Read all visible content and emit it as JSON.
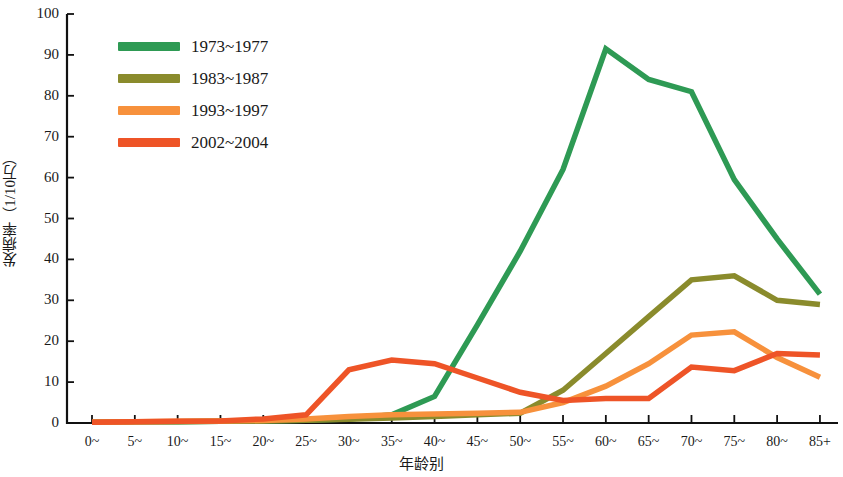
{
  "chart_data": {
    "type": "line",
    "title": "",
    "xlabel": "年龄别",
    "ylabel": "发病率（1/10万）",
    "ylim": [
      0,
      100
    ],
    "ytick_labels": [
      "100",
      "90",
      "80",
      "70",
      "60",
      "50",
      "40",
      "30",
      "20",
      "10",
      "0"
    ],
    "yticks": [
      100,
      90,
      80,
      70,
      60,
      50,
      40,
      30,
      20,
      10,
      0
    ],
    "grid": false,
    "legend_position": "top-left",
    "categories": [
      "0~",
      "5~",
      "10~",
      "15~",
      "20~",
      "25~",
      "30~",
      "35~",
      "40~",
      "45~",
      "50~",
      "55~",
      "60~",
      "65~",
      "70~",
      "75~",
      "80~",
      "85+"
    ],
    "series": [
      {
        "name": "1973~1977",
        "color": "#2E9A54",
        "values": [
          0.2,
          0.3,
          0.3,
          0.4,
          0.5,
          0.7,
          1.0,
          2.0,
          6.5,
          24.0,
          42.0,
          62.0,
          91.5,
          84.0,
          81.0,
          59.5,
          45.0,
          31.5
        ]
      },
      {
        "name": "1983~1987",
        "color": "#8A8B2C",
        "values": [
          0.2,
          0.3,
          0.3,
          0.4,
          0.5,
          0.7,
          0.9,
          1.2,
          1.6,
          2.0,
          2.4,
          8.0,
          17.0,
          26.0,
          35.0,
          36.0,
          30.0,
          29.0
        ]
      },
      {
        "name": "1993~1997",
        "color": "#F7913C",
        "values": [
          0.2,
          0.3,
          0.4,
          0.5,
          0.6,
          1.0,
          1.6,
          2.0,
          2.2,
          2.4,
          2.6,
          5.0,
          9.0,
          14.5,
          21.5,
          22.3,
          16.0,
          11.2
        ]
      },
      {
        "name": "2002~2004",
        "color": "#EE5427",
        "values": [
          0.2,
          0.3,
          0.4,
          0.5,
          1.0,
          2.0,
          13.0,
          15.4,
          14.5,
          11.0,
          7.5,
          5.5,
          6.0,
          6.0,
          13.7,
          12.8,
          17.0,
          16.6
        ]
      }
    ]
  },
  "legend": {
    "items": [
      {
        "label": "1973~1977",
        "color": "#2E9A54"
      },
      {
        "label": "1983~1987",
        "color": "#8A8B2C"
      },
      {
        "label": "1993~1997",
        "color": "#F7913C"
      },
      {
        "label": "2002~2004",
        "color": "#EE5427"
      }
    ]
  },
  "axes": {
    "y_title": "发病率（1/10万）",
    "x_title": "年龄别"
  },
  "geometry": {
    "plot_left": 67,
    "plot_right": 838,
    "plot_top": 14,
    "plot_bottom": 423,
    "x_first": 92,
    "x_step": 42.82,
    "line_width": 5.5
  }
}
